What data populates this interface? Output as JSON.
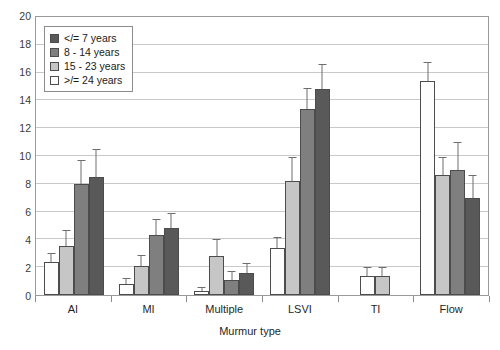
{
  "chart_data": {
    "type": "bar",
    "title": "",
    "xlabel": "Murmur type",
    "ylabel": "",
    "ylim": [
      0,
      20
    ],
    "ytick_step": 2,
    "yticks": [
      20,
      18,
      16,
      14,
      12,
      10,
      8,
      6,
      4,
      2,
      0
    ],
    "grid": true,
    "legend_position": "top-left",
    "categories": [
      "AI",
      "MI",
      "Multiple",
      "LSVI",
      "TI",
      "Flow"
    ],
    "series": [
      {
        "name": "</= 7 years",
        "color": "#595959",
        "values": [
          8.5,
          4.8,
          1.6,
          14.8,
          null,
          7.0
        ],
        "errors": [
          2.0,
          1.1,
          0.7,
          1.8,
          null,
          1.6
        ]
      },
      {
        "name": "8 - 14 years",
        "color": "#7f7f7f",
        "values": [
          8.0,
          4.3,
          1.1,
          13.4,
          null,
          9.0
        ],
        "errors": [
          1.7,
          1.2,
          0.6,
          1.5,
          null,
          2.0
        ]
      },
      {
        "name": "15 - 23 years",
        "color": "#c6c6c6",
        "values": [
          3.5,
          2.1,
          2.8,
          8.2,
          1.4,
          8.6
        ],
        "errors": [
          1.2,
          0.8,
          1.2,
          1.7,
          0.6,
          1.3
        ]
      },
      {
        "name": ">/= 24 years",
        "color": "#fdfdfd",
        "values": [
          2.4,
          0.8,
          0.3,
          3.4,
          1.4,
          15.4
        ],
        "errors": [
          0.6,
          0.4,
          0.3,
          0.8,
          0.6,
          1.4
        ]
      }
    ],
    "bar_order_in_group": [
      ">/= 24 years",
      "15 - 23 years",
      "8 - 14 years",
      "</= 7 years"
    ],
    "axis_color": "#9a9a9a",
    "gridline_color": "#c9c9c9",
    "background": "#ffffff"
  },
  "legend": {
    "items": [
      {
        "label": "</= 7 years",
        "color": "#595959"
      },
      {
        "label": "8 - 14 years",
        "color": "#7f7f7f"
      },
      {
        "label": "15 - 23 years",
        "color": "#c6c6c6"
      },
      {
        "label": ">/= 24 years",
        "color": "#fdfdfd"
      }
    ]
  }
}
